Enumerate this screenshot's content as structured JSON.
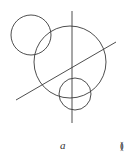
{
  "figure": {
    "label_open": "(",
    "label_letter": "a",
    "label_close": ")",
    "stroke_color": "#3a3a3a",
    "background": "#ffffff"
  },
  "shapes": {
    "circles": [
      {
        "name": "upper-left-circle",
        "cx": 31,
        "cy": 35,
        "r": 20
      },
      {
        "name": "large-center-circle",
        "cx": 70,
        "cy": 62,
        "r": 36
      },
      {
        "name": "lower-small-circle",
        "cx": 75,
        "cy": 94,
        "r": 16
      }
    ],
    "lines": [
      {
        "name": "vertical-line",
        "x1": 72,
        "y1": 11,
        "x2": 72,
        "y2": 123
      },
      {
        "name": "diagonal-line",
        "x1": 16,
        "y1": 100,
        "x2": 116,
        "y2": 42
      }
    ]
  }
}
